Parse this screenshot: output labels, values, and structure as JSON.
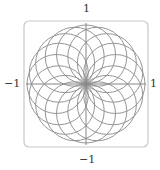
{
  "chart_data": {
    "type": "line",
    "title": "",
    "xlabel": "",
    "ylabel": "",
    "xlim": [
      -1,
      1
    ],
    "ylim": [
      -1,
      1
    ],
    "grid": false,
    "legend": null,
    "curve": {
      "num_loops": 16,
      "loop_diameter": 1,
      "angular_spacing_deg": 22.5,
      "color": "#8a8a8a"
    },
    "ticks": {
      "top": "1",
      "bottom": "−1",
      "left": "−1",
      "right": "1"
    },
    "frame": {
      "shape": "rounded-square",
      "color": "#c8c8c8"
    }
  }
}
